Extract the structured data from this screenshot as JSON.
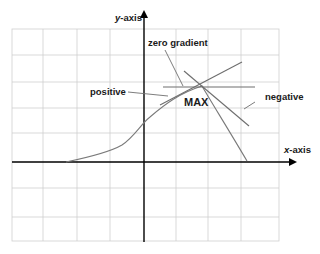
{
  "diagram": {
    "axes": {
      "x_label_italic": "x",
      "x_label_rest": "-axis",
      "y_label_italic": "y",
      "y_label_rest": "-axis"
    },
    "labels": {
      "zero_gradient": "zero gradient",
      "positive": "positive",
      "negative": "negative",
      "max": "MAX"
    },
    "colors": {
      "grid": "#cfcfcf",
      "axes": "#000000",
      "curve": "#7a7a7a",
      "tangent": "#6e6e6e",
      "text": "#1a1a1a"
    }
  }
}
